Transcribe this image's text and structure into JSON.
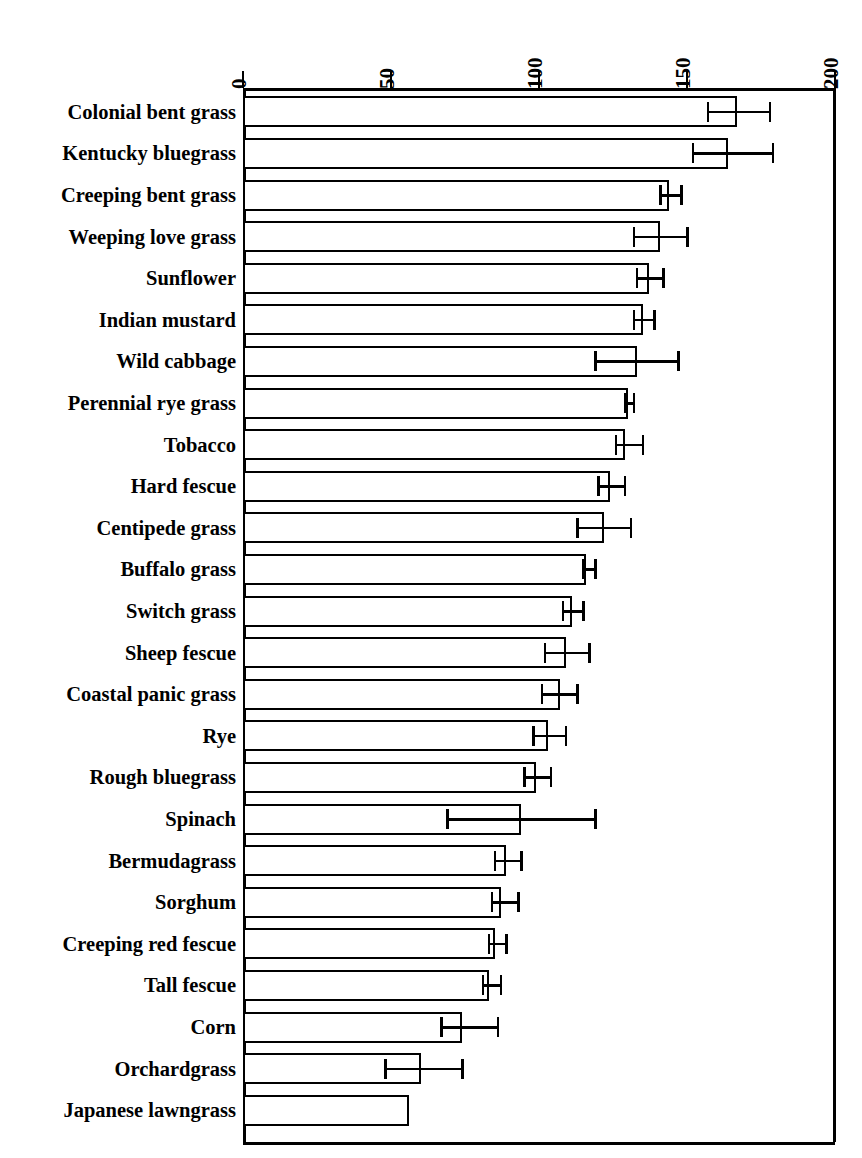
{
  "chart_data": {
    "type": "bar",
    "orientation": "horizontal",
    "title": "",
    "xlabel": "",
    "ylabel": "",
    "xlim": [
      0,
      200
    ],
    "xticks": [
      0,
      50,
      100,
      150,
      200
    ],
    "xtick_labels": [
      "0",
      "50",
      "100",
      "150",
      "200"
    ],
    "grid": false,
    "legend": null,
    "axis_position": "top",
    "tick_label_rotation": -90,
    "categories": [
      "Colonial bent grass",
      "Kentucky bluegrass",
      "Creeping bent grass",
      "Weeping love grass",
      "Sunflower",
      "Indian mustard",
      "Wild cabbage",
      "Perennial rye grass",
      "Tobacco",
      "Hard fescue",
      "Centipede grass",
      "Buffalo grass",
      "Switch grass",
      "Sheep fescue",
      "Coastal panic grass",
      "Rye",
      "Rough bluegrass",
      "Spinach",
      "Bermudagrass",
      "Sorghum",
      "Creeping red fescue",
      "Tall fescue",
      "Corn",
      "Orchardgrass",
      "Japanese lawngrass"
    ],
    "values": [
      167,
      164,
      144,
      141,
      137,
      135,
      133,
      130,
      129,
      124,
      122,
      116,
      111,
      109,
      107,
      103,
      99,
      94,
      89,
      87,
      85,
      83,
      74,
      60,
      56
    ],
    "error_low": [
      157,
      152,
      141,
      132,
      133,
      132,
      119,
      129,
      126,
      120,
      113,
      115,
      108,
      102,
      101,
      98,
      95,
      69,
      85,
      84,
      83,
      81,
      67,
      48,
      null
    ],
    "error_high": [
      178,
      179,
      148,
      150,
      142,
      139,
      147,
      132,
      135,
      129,
      131,
      119,
      115,
      117,
      113,
      109,
      104,
      119,
      94,
      93,
      89,
      87,
      86,
      74,
      null
    ],
    "series": [
      {
        "name": "mean",
        "values": [
          167,
          164,
          144,
          141,
          137,
          135,
          133,
          130,
          129,
          124,
          122,
          116,
          111,
          109,
          107,
          103,
          99,
          94,
          89,
          87,
          85,
          83,
          74,
          60,
          56
        ]
      }
    ]
  },
  "style": {
    "bar_fill": "#ffffff",
    "bar_stroke": "#000000",
    "axis_color": "#000000",
    "background": "#ffffff"
  }
}
